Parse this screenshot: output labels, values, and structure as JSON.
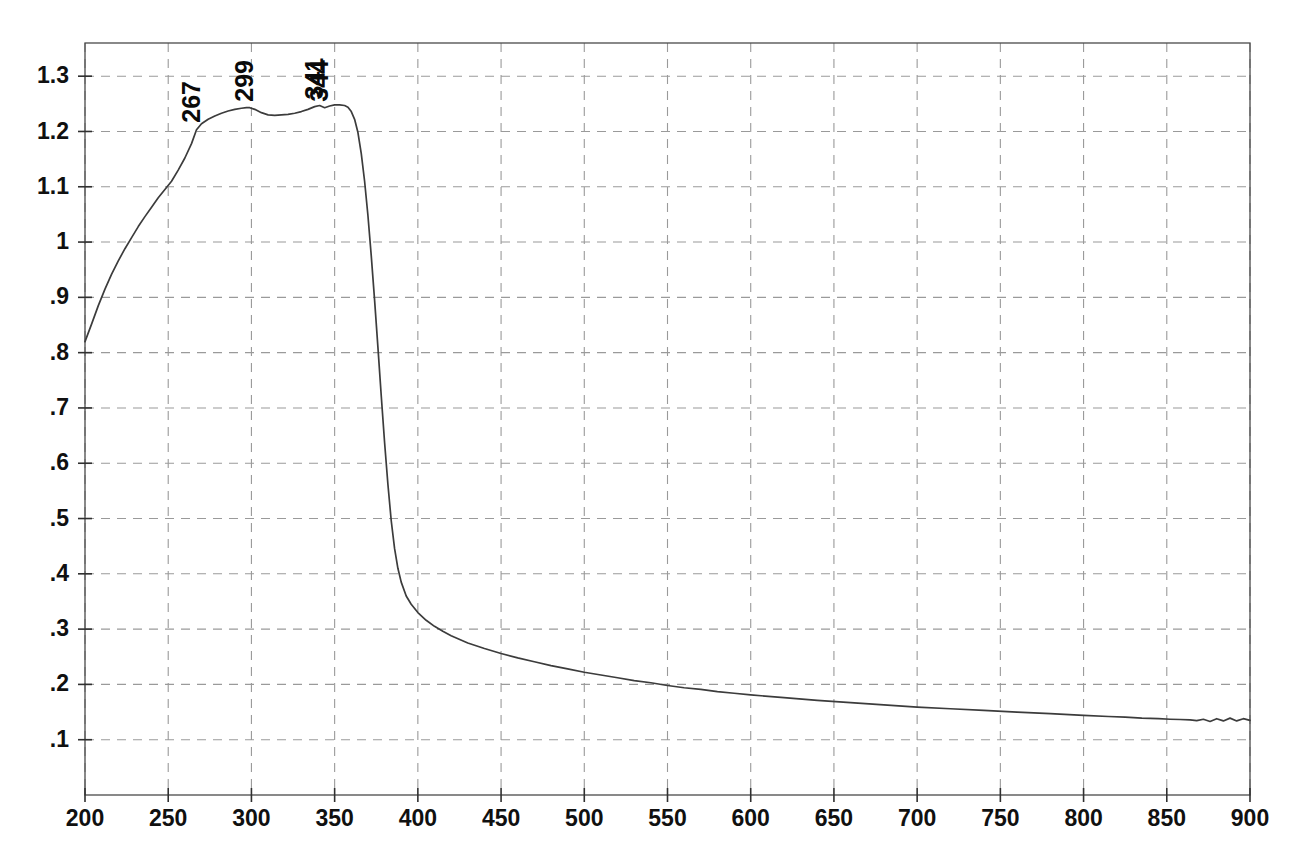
{
  "chart_data": {
    "type": "line",
    "title": "",
    "subtitle": "",
    "xlabel": "",
    "ylabel": "",
    "xlim": [
      200,
      900
    ],
    "ylim": [
      0.0,
      1.36
    ],
    "grid": true,
    "legend": false,
    "legend_position": "none",
    "line_color": "#3c3c3c",
    "grid_color": "#9a9a9a",
    "background_color": "#ffffff",
    "xticks": [
      200,
      250,
      300,
      350,
      400,
      450,
      500,
      550,
      600,
      650,
      700,
      750,
      800,
      850,
      900
    ],
    "xtick_labels": [
      "200",
      "250",
      "300",
      "350",
      "400",
      "450",
      "500",
      "550",
      "600",
      "650",
      "700",
      "750",
      "800",
      "850",
      "900"
    ],
    "yticks": [
      0.1,
      0.2,
      0.3,
      0.4,
      0.5,
      0.6,
      0.7,
      0.8,
      0.9,
      1.0,
      1.1,
      1.2,
      1.3
    ],
    "ytick_labels": [
      ".1",
      ".2",
      ".3",
      ".4",
      ".5",
      ".6",
      ".7",
      ".8",
      ".9",
      "1",
      "1.1",
      "1.2",
      "1.3"
    ],
    "annotations": [
      {
        "label": "267",
        "x": 267,
        "y": 1.205,
        "rotation": -90
      },
      {
        "label": "299",
        "x": 299,
        "y": 1.243,
        "rotation": -90
      },
      {
        "label": "341",
        "x": 341,
        "y": 1.247,
        "rotation": -90
      },
      {
        "label": "344",
        "x": 344,
        "y": 1.243,
        "rotation": -90
      }
    ],
    "series": [
      {
        "name": "absorbance",
        "x": [
          200,
          204,
          208,
          212,
          216,
          220,
          224,
          228,
          232,
          236,
          240,
          244,
          248,
          252,
          256,
          260,
          264,
          267,
          270,
          274,
          278,
          282,
          286,
          290,
          294,
          297,
          299,
          302,
          306,
          310,
          314,
          318,
          322,
          326,
          330,
          334,
          338,
          341,
          344,
          347,
          350,
          353,
          356,
          358,
          360,
          362,
          364,
          366,
          368,
          370,
          372,
          374,
          376,
          378,
          380,
          382,
          384,
          386,
          388,
          390,
          393,
          396,
          400,
          405,
          410,
          415,
          420,
          430,
          440,
          450,
          460,
          470,
          480,
          490,
          500,
          510,
          520,
          530,
          540,
          550,
          560,
          570,
          580,
          590,
          600,
          620,
          640,
          660,
          680,
          700,
          720,
          740,
          760,
          780,
          800,
          815,
          825,
          835,
          845,
          852,
          858,
          864,
          868,
          872,
          876,
          880,
          884,
          888,
          892,
          896,
          900
        ],
        "y": [
          0.82,
          0.852,
          0.885,
          0.915,
          0.942,
          0.966,
          0.988,
          1.008,
          1.028,
          1.046,
          1.063,
          1.08,
          1.095,
          1.11,
          1.13,
          1.152,
          1.178,
          1.203,
          1.214,
          1.222,
          1.228,
          1.233,
          1.237,
          1.24,
          1.242,
          1.243,
          1.243,
          1.24,
          1.234,
          1.23,
          1.229,
          1.23,
          1.231,
          1.233,
          1.236,
          1.24,
          1.245,
          1.247,
          1.243,
          1.246,
          1.248,
          1.248,
          1.247,
          1.244,
          1.236,
          1.222,
          1.198,
          1.16,
          1.11,
          1.048,
          0.975,
          0.895,
          0.81,
          0.722,
          0.638,
          0.562,
          0.496,
          0.446,
          0.41,
          0.385,
          0.36,
          0.345,
          0.33,
          0.316,
          0.305,
          0.296,
          0.288,
          0.275,
          0.265,
          0.256,
          0.248,
          0.241,
          0.234,
          0.228,
          0.222,
          0.217,
          0.212,
          0.207,
          0.203,
          0.198,
          0.194,
          0.191,
          0.187,
          0.184,
          0.181,
          0.176,
          0.171,
          0.167,
          0.163,
          0.159,
          0.156,
          0.153,
          0.15,
          0.147,
          0.144,
          0.142,
          0.141,
          0.139,
          0.138,
          0.137,
          0.1365,
          0.136,
          0.1345,
          0.137,
          0.133,
          0.138,
          0.134,
          0.139,
          0.134,
          0.138,
          0.135
        ]
      }
    ]
  },
  "plot_geometry": {
    "left": 85,
    "right": 1250,
    "top": 43,
    "bottom": 795
  }
}
